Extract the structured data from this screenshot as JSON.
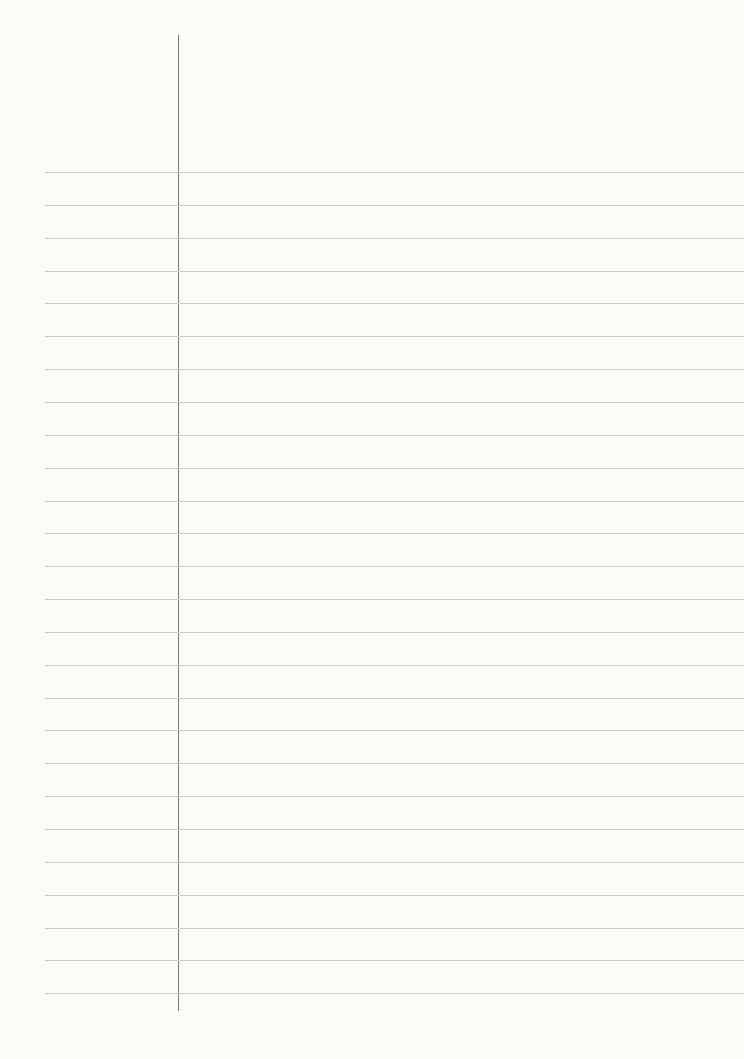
{
  "paper": {
    "type": "lined-notebook-page",
    "rule_count": 26,
    "first_rule_y": 172,
    "rule_spacing": 32.85,
    "rule_color": "#c9cbcd",
    "margin_line_color": "#7a7a7a",
    "background": "#fbfbfa",
    "text": ""
  }
}
